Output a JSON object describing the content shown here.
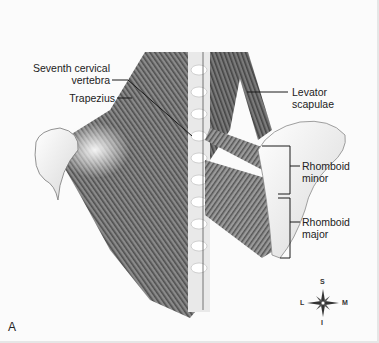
{
  "figure": {
    "panel_label": "A",
    "labels": [
      {
        "id": "seventh-cervical-vertebra",
        "text_lines": [
          "Seventh cervical",
          "vertebra"
        ]
      },
      {
        "id": "trapezius",
        "text_lines": [
          "Trapezius"
        ]
      },
      {
        "id": "levator-scapulae",
        "text_lines": [
          "Levator",
          "scapulae"
        ]
      },
      {
        "id": "rhomboid-minor",
        "text_lines": [
          "Rhomboid",
          "minor"
        ]
      },
      {
        "id": "rhomboid-major",
        "text_lines": [
          "Rhomboid",
          "major"
        ]
      }
    ],
    "compass": {
      "top": "S",
      "bottom": "I",
      "left": "L",
      "right": "M"
    },
    "colors": {
      "muscle": "#6e6e6e",
      "bone": "#f2f2f2",
      "leader": "#1a1a1a",
      "background": "#fbfbfb"
    }
  }
}
